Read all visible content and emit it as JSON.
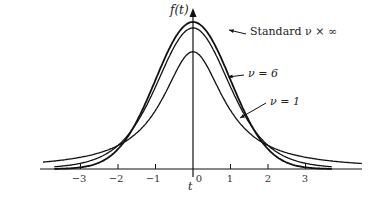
{
  "chart_data": {
    "type": "line",
    "title": "",
    "xlabel": "t",
    "ylabel": "f(t)",
    "xlim": [
      -3.8,
      4.8
    ],
    "x_ticks": [
      "-3",
      "-2",
      "-1",
      "0",
      "1",
      "2",
      "3"
    ],
    "grid": false,
    "legend": "inline annotations with arrows",
    "series": [
      {
        "name": "Standard ν × ∞",
        "dist": "normal",
        "peak": 0.399
      },
      {
        "name": "ν = 6",
        "dist": "student-t",
        "df": 6,
        "peak": 0.383
      },
      {
        "name": "ν = 1",
        "dist": "student-t",
        "df": 1,
        "peak": 0.318
      }
    ],
    "annotations": [
      "Standard ν × ∞",
      "ν = 6",
      "ν = 1"
    ]
  },
  "labels": {
    "ylabel": "f(t)",
    "xlabel": "t",
    "standard": "Standard ν × ∞",
    "v6": "ν = 6",
    "v1": "ν = 1",
    "ticks": [
      "−3",
      "−2",
      "−1",
      "0",
      "1",
      "2",
      "3"
    ]
  }
}
